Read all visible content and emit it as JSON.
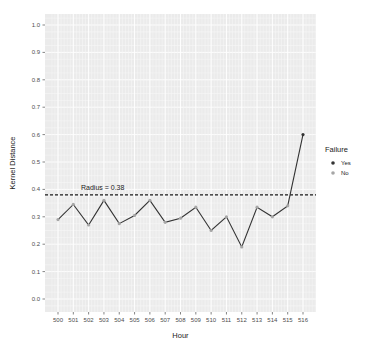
{
  "chart_data": {
    "type": "line",
    "title": "",
    "xlabel": "Hour",
    "ylabel": "Kernel Distance",
    "categories": [
      "500",
      "501",
      "502",
      "503",
      "504",
      "505",
      "506",
      "507",
      "508",
      "509",
      "510",
      "511",
      "512",
      "513",
      "514",
      "515",
      "516"
    ],
    "series": [
      {
        "name": "Kernel Distance",
        "values": [
          0.29,
          0.345,
          0.27,
          0.36,
          0.275,
          0.305,
          0.36,
          0.28,
          0.295,
          0.335,
          0.25,
          0.3,
          0.19,
          0.335,
          0.3,
          0.34,
          0.6
        ],
        "failure": [
          "No",
          "No",
          "No",
          "No",
          "No",
          "No",
          "No",
          "No",
          "No",
          "No",
          "No",
          "No",
          "No",
          "No",
          "No",
          "No",
          "Yes"
        ]
      }
    ],
    "ylim": [
      0.0,
      1.0
    ],
    "yticks": [
      "0.0",
      "0.1",
      "0.2",
      "0.3",
      "0.4",
      "0.5",
      "0.6",
      "0.7",
      "0.8",
      "0.9",
      "1.0"
    ],
    "grid": true,
    "reference_line": {
      "y": 0.38,
      "style": "dashed",
      "label": "Radius = 0.38"
    },
    "legend": {
      "title": "Failure",
      "position": "right",
      "entries": [
        {
          "label": "Yes",
          "color": "#333333"
        },
        {
          "label": "No",
          "color": "#a6a6a6"
        }
      ]
    }
  },
  "colors": {
    "panel_bg": "#ebebeb",
    "grid_major": "#ffffff",
    "line": "#333333",
    "point_yes": "#333333",
    "point_no": "#a6a6a6"
  }
}
